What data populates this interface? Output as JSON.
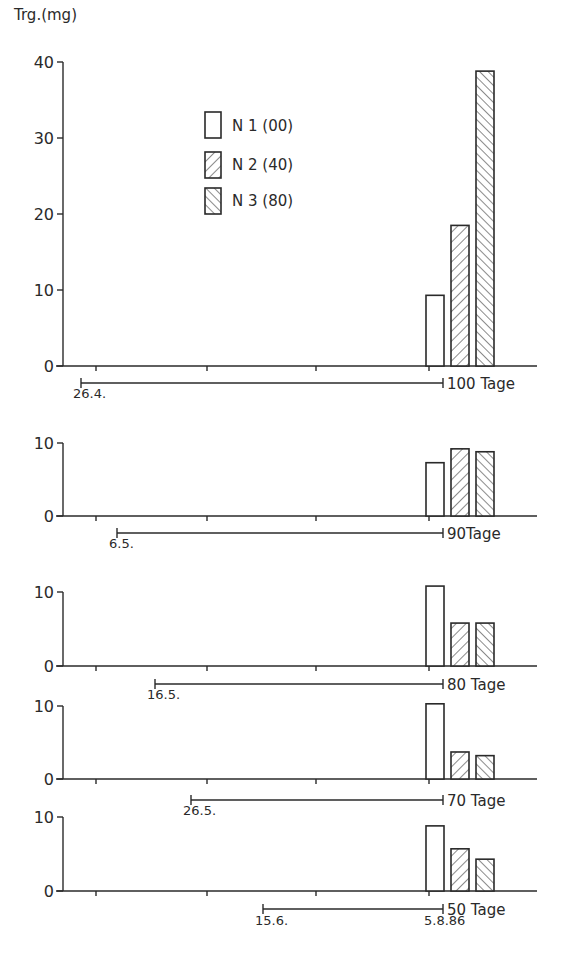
{
  "chart_data": {
    "type": "bar",
    "ylabel": "Trg.(mg)",
    "series_names": [
      "N1 (00)",
      "N2 (40)",
      "N3 (80)"
    ],
    "legend": [
      {
        "label": "N 1 (00)",
        "pattern": "none"
      },
      {
        "label": "N 2 (40)",
        "pattern": "forward-hatch"
      },
      {
        "label": "N 3 (80)",
        "pattern": "back-hatch"
      }
    ],
    "panels": [
      {
        "duration_label": "100 Tage",
        "start_date": "26.4.",
        "end_date": "",
        "ylim": [
          0,
          40
        ],
        "yticks": [
          0,
          10,
          20,
          30,
          40
        ],
        "values": {
          "N1 (00)": 9.3,
          "N2 (40)": 18.5,
          "N3 (80)": 38.8
        }
      },
      {
        "duration_label": "90Tage",
        "start_date": "6.5.",
        "end_date": "",
        "ylim": [
          0,
          10
        ],
        "yticks": [
          0,
          10
        ],
        "values": {
          "N1 (00)": 7.3,
          "N2 (40)": 9.2,
          "N3 (80)": 8.8
        }
      },
      {
        "duration_label": "80 Tage",
        "start_date": "16.5.",
        "end_date": "",
        "ylim": [
          0,
          10
        ],
        "yticks": [
          0,
          10
        ],
        "values": {
          "N1 (00)": 10.8,
          "N2 (40)": 5.8,
          "N3 (80)": 5.8
        }
      },
      {
        "duration_label": "70 Tage",
        "start_date": "26.5.",
        "end_date": "",
        "ylim": [
          0,
          10
        ],
        "yticks": [
          0,
          10
        ],
        "values": {
          "N1 (00)": 10.3,
          "N2 (40)": 3.7,
          "N3 (80)": 3.2
        }
      },
      {
        "duration_label": "50 Tage",
        "start_date": "15.6.",
        "end_date": "5.8.86",
        "ylim": [
          0,
          10
        ],
        "yticks": [
          0,
          10
        ],
        "values": {
          "N1 (00)": 8.8,
          "N2 (40)": 5.7,
          "N3 (80)": 4.3
        }
      }
    ]
  },
  "layout": {
    "panels": [
      {
        "y0": 366,
        "pxPerUnit": 7.6,
        "tickLabels": [
          "0",
          "10",
          "20",
          "30",
          "40"
        ],
        "lineY": 383,
        "startX": 81,
        "startLabelY": 398
      },
      {
        "y0": 516,
        "pxPerUnit": 7.3,
        "tickLabels": [
          "0",
          "10"
        ],
        "lineY": 533,
        "startX": 117,
        "startLabelY": 548
      },
      {
        "y0": 666,
        "pxPerUnit": 7.4,
        "tickLabels": [
          "0",
          "10"
        ],
        "lineY": 684,
        "startX": 155,
        "startLabelY": 699
      },
      {
        "y0": 779,
        "pxPerUnit": 7.3,
        "tickLabels": [
          "0",
          "10"
        ],
        "lineY": 800,
        "startX": 191,
        "startLabelY": 815
      },
      {
        "y0": 891,
        "pxPerUnit": 7.4,
        "tickLabels": [
          "0",
          "10"
        ],
        "lineY": 909,
        "startX": 263,
        "startLabelY": 925
      }
    ]
  }
}
